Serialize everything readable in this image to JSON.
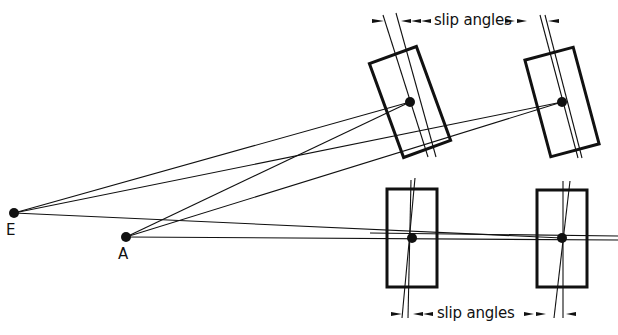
{
  "diagram": {
    "type": "vehicle-steering-slip-angle-diagram",
    "colors": {
      "stroke": "#111111",
      "background": "#ffffff"
    },
    "points": [
      {
        "id": "E",
        "label": "E",
        "x": 14,
        "y": 213
      },
      {
        "id": "A",
        "label": "A",
        "x": 126,
        "y": 237
      }
    ],
    "wheels": [
      {
        "id": "front-left-top",
        "cx": 410,
        "cy": 102,
        "w": 50,
        "h": 100,
        "angle": -20
      },
      {
        "id": "front-right-top",
        "cx": 562,
        "cy": 102,
        "w": 50,
        "h": 100,
        "angle": -15
      },
      {
        "id": "rear-left-bottom",
        "cx": 412,
        "cy": 238,
        "w": 50,
        "h": 99,
        "angle": 0
      },
      {
        "id": "rear-right-bottom",
        "cx": 562,
        "cy": 238,
        "w": 50,
        "h": 97,
        "angle": 0
      }
    ],
    "labels": {
      "top_slip": "slip angles",
      "bottom_slip": "slip angles",
      "point_E": "E",
      "point_A": "A"
    }
  }
}
